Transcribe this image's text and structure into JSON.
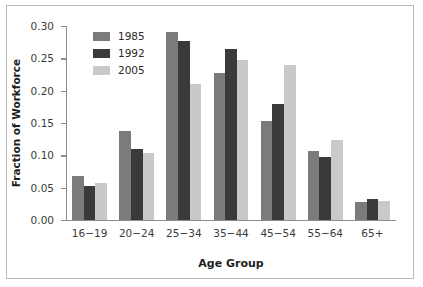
{
  "chart_data": {
    "type": "bar",
    "title": "",
    "xlabel": "Age Group",
    "ylabel": "Fraction of Workforce",
    "ylim": [
      0.0,
      0.3
    ],
    "ytick_labels": [
      "0.00",
      "0.05",
      "0.10",
      "0.15",
      "0.20",
      "0.25",
      "0.30"
    ],
    "ytick_values": [
      0.0,
      0.05,
      0.1,
      0.15,
      0.2,
      0.25,
      0.3
    ],
    "grid": false,
    "legend_position": "upper-left-inside",
    "categories": [
      "16−19",
      "20−24",
      "25−34",
      "35−44",
      "45−54",
      "55−64",
      "65+"
    ],
    "series": [
      {
        "name": "1985",
        "color": "#7b7b7b",
        "values": [
          0.068,
          0.137,
          0.29,
          0.227,
          0.153,
          0.107,
          0.028
        ]
      },
      {
        "name": "1992",
        "color": "#3a3a3a",
        "values": [
          0.053,
          0.11,
          0.277,
          0.265,
          0.179,
          0.097,
          0.032
        ]
      },
      {
        "name": "2005",
        "color": "#c9c9c9",
        "values": [
          0.057,
          0.103,
          0.211,
          0.247,
          0.239,
          0.124,
          0.03
        ]
      }
    ]
  }
}
